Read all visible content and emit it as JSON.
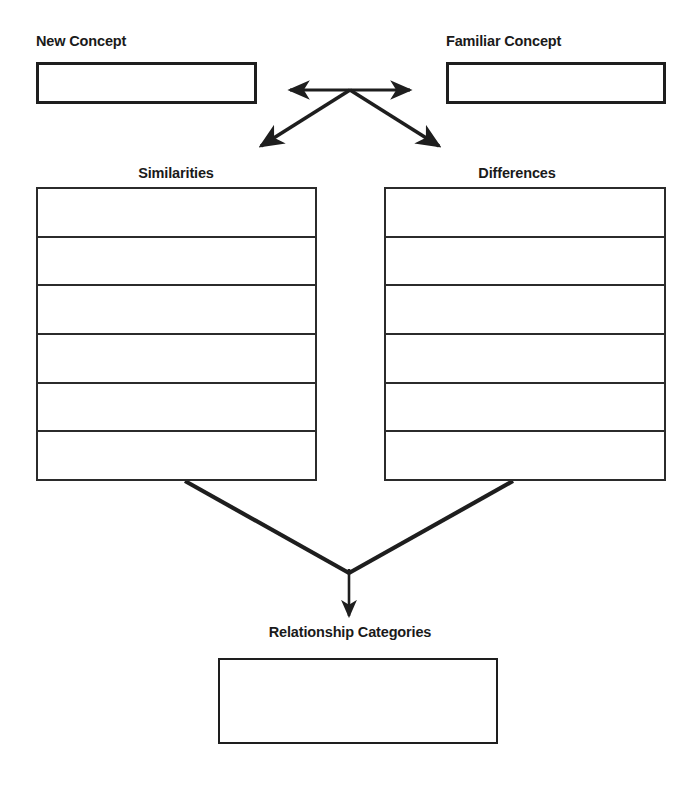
{
  "worksheet": {
    "title": "Concept Comparison Graphic Organizer",
    "ink_color": "#1e1e1e",
    "paper_color": "#ffffff"
  },
  "top_row": {
    "left": {
      "label": "New Concept",
      "field_value": "",
      "placeholder": ""
    },
    "right": {
      "label": "Familiar Concept",
      "field_value": "",
      "placeholder": ""
    }
  },
  "middle_row": {
    "left": {
      "label": "Similarities",
      "rows": [
        "",
        "",
        "",
        "",
        "",
        ""
      ]
    },
    "right": {
      "label": "Differences",
      "rows": [
        "",
        "",
        "",
        "",
        "",
        ""
      ]
    }
  },
  "bottom_row": {
    "label": "Relationship Categories",
    "field_value": "",
    "placeholder": ""
  },
  "connectors": [
    {
      "name": "left-right-double-arrow",
      "kind": "double-headed-horizontal"
    },
    {
      "name": "down-left-arrow",
      "kind": "single-headed-diagonal"
    },
    {
      "name": "down-right-arrow",
      "kind": "single-headed-diagonal"
    },
    {
      "name": "similarities-converge-line",
      "kind": "plain-diagonal"
    },
    {
      "name": "differences-converge-line",
      "kind": "plain-diagonal"
    },
    {
      "name": "relationship-down-arrow",
      "kind": "single-headed-vertical"
    }
  ]
}
